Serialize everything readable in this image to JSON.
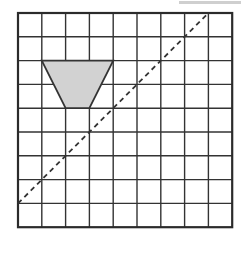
{
  "figure": {
    "caption": "",
    "background_color": "#ffffff"
  },
  "artifact": {
    "name": "top-right-gray-bar",
    "color": "#cfcfcf",
    "x": 179,
    "y": 1,
    "width": 62,
    "height": 3
  },
  "chart_data": {
    "type": "scatter",
    "title": "Grid with shaded trapezoid and dashed diagonal line",
    "subtitle": "",
    "xlabel": "",
    "ylabel": "",
    "xlim": [
      0,
      9
    ],
    "ylim": [
      0,
      9
    ],
    "grid": true,
    "legend_position": "none",
    "tick_labels_x": [],
    "tick_labels_y": [],
    "annotations": [],
    "grid_spec": {
      "columns": 9,
      "rows": 9,
      "cell_size_px": 23.8,
      "origin_x_px": 18,
      "origin_y_px": 13,
      "line_color": "#333333",
      "line_width_px": 1.4,
      "border_color": "#2b2b2b",
      "border_width_px": 2.2
    },
    "shapes": [
      {
        "name": "shaded-trapezoid",
        "type": "polygon",
        "fill": "#d2d2d2",
        "stroke": "#333333",
        "stroke_width_px": 1.8,
        "grid_points": [
          [
            1,
            2
          ],
          [
            4,
            2
          ],
          [
            3,
            4
          ],
          [
            2,
            4
          ]
        ]
      }
    ],
    "lines": [
      {
        "name": "dashed-diagonal-line",
        "type": "line",
        "style": "dashed",
        "stroke": "#333333",
        "stroke_width_px": 1.8,
        "dash_pattern": "5,4",
        "grid_start": [
          0,
          8
        ],
        "grid_end": [
          8,
          0
        ]
      }
    ]
  }
}
